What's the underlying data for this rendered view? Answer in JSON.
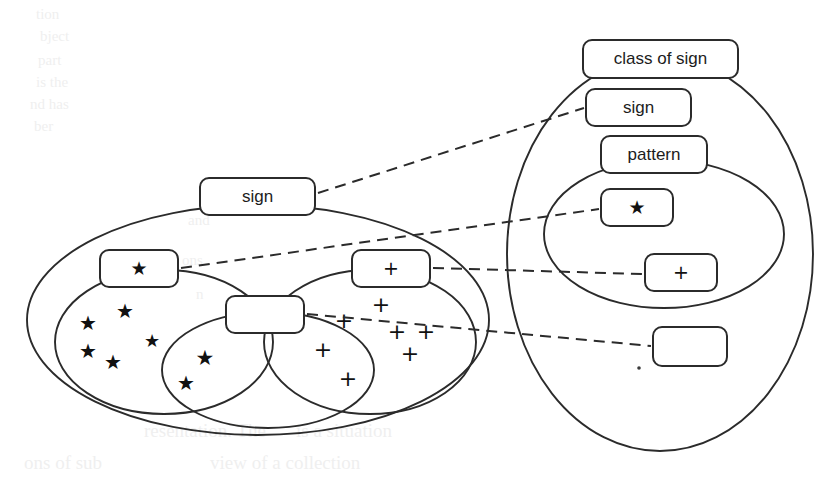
{
  "figure": {
    "title": "",
    "background_color": "#ffffff",
    "stroke_color": "#2b2b2b",
    "dash_color": "#2b2b2b"
  },
  "left_group": {
    "name": "instance-domain",
    "outer_ellipse_label": "sign",
    "boxes": [
      {
        "id": "left-sign",
        "label": "sign",
        "glyph": "text"
      },
      {
        "id": "left-star",
        "label": "★",
        "glyph": "star"
      },
      {
        "id": "left-empty",
        "label": "",
        "glyph": "empty"
      },
      {
        "id": "left-plus",
        "label": "+",
        "glyph": "plus"
      }
    ],
    "star_marks": [
      {
        "x": 88,
        "y": 324,
        "size": 20
      },
      {
        "x": 125,
        "y": 312,
        "size": 20
      },
      {
        "x": 152,
        "y": 342,
        "size": 18
      },
      {
        "x": 88,
        "y": 352,
        "size": 20
      },
      {
        "x": 113,
        "y": 363,
        "size": 20
      },
      {
        "x": 205,
        "y": 359,
        "size": 21
      },
      {
        "x": 186,
        "y": 384,
        "size": 20
      }
    ],
    "plus_marks": [
      {
        "x": 381,
        "y": 306,
        "size": 22
      },
      {
        "x": 344,
        "y": 322,
        "size": 22
      },
      {
        "x": 397,
        "y": 333,
        "size": 22
      },
      {
        "x": 426,
        "y": 333,
        "size": 22
      },
      {
        "x": 323,
        "y": 351,
        "size": 22
      },
      {
        "x": 410,
        "y": 355,
        "size": 22
      },
      {
        "x": 348,
        "y": 380,
        "size": 22
      }
    ]
  },
  "right_group": {
    "name": "class-domain",
    "boxes": [
      {
        "id": "right-class-of-sign",
        "label": "class of sign",
        "glyph": "text"
      },
      {
        "id": "right-sign",
        "label": "sign",
        "glyph": "text"
      },
      {
        "id": "right-pattern",
        "label": "pattern",
        "glyph": "text"
      },
      {
        "id": "right-star",
        "label": "★",
        "glyph": "star"
      },
      {
        "id": "right-plus",
        "label": "+",
        "glyph": "plus"
      },
      {
        "id": "right-empty",
        "label": "",
        "glyph": "empty"
      }
    ]
  },
  "mappings": [
    {
      "id": "map-sign",
      "from": "left-sign",
      "to": "right-sign"
    },
    {
      "id": "map-star",
      "from": "left-star",
      "to": "right-star"
    },
    {
      "id": "map-plus",
      "from": "left-plus",
      "to": "right-plus"
    },
    {
      "id": "map-empty",
      "from": "left-empty",
      "to": "right-empty"
    }
  ],
  "bleed_through": [
    {
      "text": "tion",
      "x": 36,
      "y": 6,
      "size": 15
    },
    {
      "text": "bject",
      "x": 40,
      "y": 28,
      "size": 15
    },
    {
      "text": "part",
      "x": 38,
      "y": 52,
      "size": 15
    },
    {
      "text": "is the",
      "x": 36,
      "y": 74,
      "size": 15
    },
    {
      "text": "nd has",
      "x": 30,
      "y": 96,
      "size": 15
    },
    {
      "text": "ber",
      "x": 34,
      "y": 118,
      "size": 15
    },
    {
      "text": "and",
      "x": 188,
      "y": 212,
      "size": 15
    },
    {
      "text": "ons",
      "x": 182,
      "y": 252,
      "size": 15
    },
    {
      "text": "n",
      "x": 196,
      "y": 286,
      "size": 15
    },
    {
      "text": "resentation.  The",
      "x": 144,
      "y": 420,
      "size": 19
    },
    {
      "text": "is a situation",
      "x": 296,
      "y": 420,
      "size": 19
    },
    {
      "text": "view  of  a  collection",
      "x": 210,
      "y": 452,
      "size": 19
    },
    {
      "text": "ons of sub",
      "x": 24,
      "y": 452,
      "size": 19
    }
  ]
}
